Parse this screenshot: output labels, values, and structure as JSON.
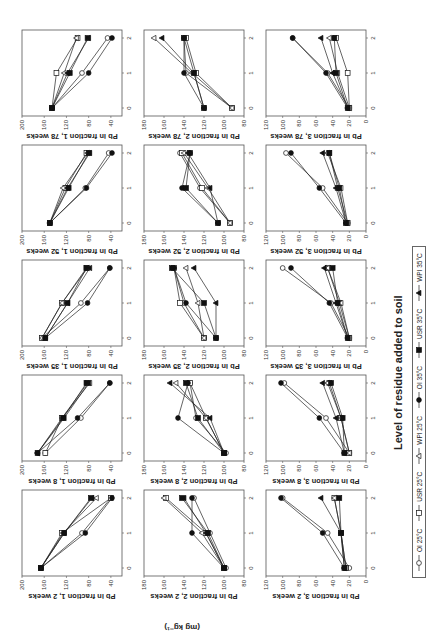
{
  "figure": {
    "x_title": "Level of residue added to soil",
    "units_label": "(mg kg⁻¹)"
  },
  "legend": [
    {
      "label": "OI 25°C",
      "marker": "circle",
      "filled": false
    },
    {
      "label": "USR 25°C",
      "marker": "square",
      "filled": false
    },
    {
      "label": "WPI 25°C",
      "marker": "triangle",
      "filled": false
    },
    {
      "label": "OI 35°C",
      "marker": "circle",
      "filled": true
    },
    {
      "label": "USR 35°C",
      "marker": "square",
      "filled": true
    },
    {
      "label": "WPI 35°C",
      "marker": "triangle",
      "filled": true
    }
  ],
  "chart_data": [
    {
      "type": "line",
      "title": "Pb in fraction 1, 2 weeks",
      "ylabel": "Pb in fraction 1, 2 weeks",
      "x": [
        0,
        1,
        2
      ],
      "ylim": [
        20,
        200
      ],
      "yticks": [
        40,
        80,
        120,
        160,
        200
      ],
      "series": [
        {
          "name": "OI 25°C",
          "values": [
            166,
            92,
            40
          ]
        },
        {
          "name": "USR 25°C",
          "values": [
            166,
            128,
            40
          ]
        },
        {
          "name": "WPI 25°C",
          "values": [
            166,
            126,
            66
          ]
        },
        {
          "name": "OI 35°C",
          "values": [
            166,
            86,
            38
          ]
        },
        {
          "name": "USR 35°C",
          "values": [
            166,
            124,
            76
          ]
        },
        {
          "name": "WPI 35°C",
          "values": [
            166,
            124,
            74
          ]
        }
      ]
    },
    {
      "type": "line",
      "title": "Pb in fraction 1, 8 weeks",
      "ylabel": "Pb in fraction 1, 8 weeks",
      "x": [
        0,
        1,
        2
      ],
      "ylim": [
        20,
        200
      ],
      "yticks": [
        40,
        80,
        120,
        160,
        200
      ],
      "series": [
        {
          "name": "OI 25°C",
          "values": [
            158,
            94,
            42
          ]
        },
        {
          "name": "USR 25°C",
          "values": [
            158,
            128,
            82
          ]
        },
        {
          "name": "WPI 25°C",
          "values": [
            172,
            128,
            78
          ]
        },
        {
          "name": "OI 35°C",
          "values": [
            172,
            100,
            42
          ]
        },
        {
          "name": "USR 35°C",
          "values": [
            172,
            126,
            84
          ]
        },
        {
          "name": "WPI 35°C",
          "values": [
            172,
            124,
            80
          ]
        }
      ]
    },
    {
      "type": "line",
      "title": "Pb in fraction 1, 35 weeks",
      "ylabel": "Pb in fraction 1, 35 weeks",
      "x": [
        0,
        1,
        2
      ],
      "ylim": [
        20,
        200
      ],
      "yticks": [
        40,
        80,
        120,
        160,
        200
      ],
      "series": [
        {
          "name": "OI 25°C",
          "values": [
            164,
            94,
            42
          ]
        },
        {
          "name": "USR 25°C",
          "values": [
            164,
            128,
            84
          ]
        },
        {
          "name": "WPI 25°C",
          "values": [
            164,
            128,
            82
          ]
        },
        {
          "name": "OI 35°C",
          "values": [
            158,
            82,
            42
          ]
        },
        {
          "name": "USR 35°C",
          "values": [
            158,
            118,
            84
          ]
        },
        {
          "name": "WPI 35°C",
          "values": [
            158,
            118,
            78
          ]
        }
      ]
    },
    {
      "type": "line",
      "title": "Pb in fraction 1, 52 weeks",
      "ylabel": "Pb in fraction 1, 52 weeks",
      "x": [
        0,
        1,
        2
      ],
      "ylim": [
        20,
        200
      ],
      "yticks": [
        40,
        80,
        120,
        160,
        200
      ],
      "series": [
        {
          "name": "OI 25°C",
          "values": [
            150,
            86,
            44
          ]
        },
        {
          "name": "USR 25°C",
          "values": [
            150,
            122,
            84
          ]
        },
        {
          "name": "WPI 25°C",
          "values": [
            150,
            126,
            82
          ]
        },
        {
          "name": "OI 35°C",
          "values": [
            150,
            84,
            38
          ]
        },
        {
          "name": "USR 35°C",
          "values": [
            150,
            116,
            80
          ]
        },
        {
          "name": "WPI 35°C",
          "values": [
            150,
            118,
            78
          ]
        }
      ]
    },
    {
      "type": "line",
      "title": "Pb in fraction 1, 78 weeks",
      "ylabel": "Pb in fraction 1, 78 weeks",
      "x": [
        0,
        1,
        2
      ],
      "ylim": [
        20,
        200
      ],
      "yticks": [
        40,
        80,
        120,
        160,
        200
      ],
      "series": [
        {
          "name": "OI 25°C",
          "values": [
            146,
            92,
            46
          ]
        },
        {
          "name": "USR 25°C",
          "values": [
            146,
            138,
            100
          ]
        },
        {
          "name": "WPI 25°C",
          "values": [
            146,
            124,
            102
          ]
        },
        {
          "name": "OI 35°C",
          "values": [
            146,
            80,
            38
          ]
        },
        {
          "name": "USR 35°C",
          "values": [
            146,
            114,
            82
          ]
        },
        {
          "name": "WPI 35°C",
          "values": [
            146,
            118,
            80
          ]
        }
      ]
    },
    {
      "type": "line",
      "title": "Pb in fraction 2, 2 weeks",
      "ylabel": "Pb in fraction 2, 2 weeks",
      "x": [
        0,
        1,
        2
      ],
      "ylim": [
        80,
        180
      ],
      "yticks": [
        80,
        100,
        120,
        140,
        160,
        180
      ],
      "series": [
        {
          "name": "OI 25°C",
          "values": [
            98,
            114,
            130
          ]
        },
        {
          "name": "USR 25°C",
          "values": [
            100,
            118,
            158
          ]
        },
        {
          "name": "WPI 25°C",
          "values": [
            100,
            122,
            160
          ]
        },
        {
          "name": "OI 35°C",
          "values": [
            100,
            132,
            132
          ]
        },
        {
          "name": "USR 35°C",
          "values": [
            100,
            116,
            142
          ]
        },
        {
          "name": "WPI 35°C",
          "values": [
            100,
            118,
            140
          ]
        }
      ]
    },
    {
      "type": "line",
      "title": "Pb in fraction 2, 8 weeks",
      "ylabel": "Pb in fraction 2, 8 weeks",
      "x": [
        0,
        1,
        2
      ],
      "ylim": [
        80,
        180
      ],
      "yticks": [
        80,
        100,
        120,
        140,
        160,
        180
      ],
      "series": [
        {
          "name": "OI 25°C",
          "values": [
            98,
            128,
            134
          ]
        },
        {
          "name": "USR 25°C",
          "values": [
            100,
            118,
            134
          ]
        },
        {
          "name": "WPI 25°C",
          "values": [
            100,
            118,
            148
          ]
        },
        {
          "name": "OI 35°C",
          "values": [
            100,
            146,
            136
          ]
        },
        {
          "name": "USR 35°C",
          "values": [
            100,
            126,
            138
          ]
        },
        {
          "name": "WPI 35°C",
          "values": [
            100,
            114,
            154
          ]
        }
      ]
    },
    {
      "type": "line",
      "title": "Pb in fraction 2, 35 weeks",
      "ylabel": "Pb in fraction 2, 35 weeks",
      "x": [
        0,
        1,
        2
      ],
      "ylim": [
        80,
        180
      ],
      "yticks": [
        80,
        100,
        120,
        140,
        160,
        180
      ],
      "series": [
        {
          "name": "OI 25°C",
          "values": [
            120,
            140,
            150
          ]
        },
        {
          "name": "USR 25°C",
          "values": [
            120,
            144,
            150
          ]
        },
        {
          "name": "WPI 25°C",
          "values": [
            120,
            126,
            138
          ]
        },
        {
          "name": "OI 35°C",
          "values": [
            108,
            138,
            150
          ]
        },
        {
          "name": "USR 35°C",
          "values": [
            108,
            120,
            152
          ]
        },
        {
          "name": "WPI 35°C",
          "values": [
            108,
            108,
            130
          ]
        }
      ]
    },
    {
      "type": "line",
      "title": "Pb in fraction 2, 52 weeks",
      "ylabel": "Pb in fraction 2, 52 weeks",
      "x": [
        0,
        1,
        2
      ],
      "ylim": [
        80,
        180
      ],
      "yticks": [
        80,
        100,
        120,
        140,
        160,
        180
      ],
      "series": [
        {
          "name": "OI 25°C",
          "values": [
            94,
            124,
            144
          ]
        },
        {
          "name": "USR 25°C",
          "values": [
            94,
            122,
            142
          ]
        },
        {
          "name": "WPI 25°C",
          "values": [
            94,
            116,
            140
          ]
        },
        {
          "name": "OI 35°C",
          "values": [
            106,
            142,
            134
          ]
        },
        {
          "name": "USR 35°C",
          "values": [
            106,
            138,
            134
          ]
        },
        {
          "name": "WPI 35°C",
          "values": [
            106,
            114,
            136
          ]
        }
      ]
    },
    {
      "type": "line",
      "title": "Pb in fraction 2, 78 weeks",
      "ylabel": "Pb in fraction 2, 78 weeks",
      "x": [
        0,
        1,
        2
      ],
      "ylim": [
        80,
        180
      ],
      "yticks": [
        80,
        100,
        120,
        140,
        160,
        180
      ],
      "series": [
        {
          "name": "OI 25°C",
          "values": [
            92,
            138,
            140
          ]
        },
        {
          "name": "USR 25°C",
          "values": [
            92,
            128,
            138
          ]
        },
        {
          "name": "WPI 25°C",
          "values": [
            92,
            132,
            170
          ]
        },
        {
          "name": "OI 35°C",
          "values": [
            120,
            140,
            140
          ]
        },
        {
          "name": "USR 35°C",
          "values": [
            120,
            130,
            140
          ]
        },
        {
          "name": "WPI 35°C",
          "values": [
            120,
            130,
            162
          ]
        }
      ]
    },
    {
      "type": "line",
      "title": "Pb in fraction 3, 2 weeks",
      "ylabel": "Pb in fraction 3, 2 weeks",
      "x": [
        0,
        1,
        2
      ],
      "ylim": [
        0,
        120
      ],
      "yticks": [
        0,
        20,
        40,
        60,
        80,
        100,
        120
      ],
      "series": [
        {
          "name": "OI 25°C",
          "values": [
            20,
            46,
            100
          ]
        },
        {
          "name": "USR 25°C",
          "values": [
            24,
            30,
            38
          ]
        },
        {
          "name": "WPI 25°C",
          "values": [
            24,
            30,
            38
          ]
        },
        {
          "name": "OI 35°C",
          "values": [
            26,
            52,
            102
          ]
        },
        {
          "name": "USR 35°C",
          "values": [
            26,
            30,
            32
          ]
        },
        {
          "name": "WPI 35°C",
          "values": [
            26,
            30,
            54
          ]
        }
      ]
    },
    {
      "type": "line",
      "title": "Pb in fraction 3, 8 weeks",
      "ylabel": "Pb in fraction 3, 8 weeks",
      "x": [
        0,
        1,
        2
      ],
      "ylim": [
        0,
        120
      ],
      "yticks": [
        0,
        20,
        40,
        60,
        80,
        100,
        120
      ],
      "series": [
        {
          "name": "OI 25°C",
          "values": [
            20,
            48,
            98
          ]
        },
        {
          "name": "USR 25°C",
          "values": [
            20,
            30,
            44
          ]
        },
        {
          "name": "WPI 25°C",
          "values": [
            20,
            30,
            46
          ]
        },
        {
          "name": "OI 35°C",
          "values": [
            26,
            56,
            102
          ]
        },
        {
          "name": "USR 35°C",
          "values": [
            26,
            28,
            42
          ]
        },
        {
          "name": "WPI 35°C",
          "values": [
            26,
            36,
            52
          ]
        }
      ]
    },
    {
      "type": "line",
      "title": "Pb in fraction 3, 35 weeks",
      "ylabel": "Pb in fraction 3, 35 weeks",
      "x": [
        0,
        1,
        2
      ],
      "ylim": [
        0,
        120
      ],
      "yticks": [
        0,
        20,
        40,
        60,
        80,
        100,
        120
      ],
      "series": [
        {
          "name": "OI 25°C",
          "values": [
            20,
            42,
            100
          ]
        },
        {
          "name": "USR 25°C",
          "values": [
            20,
            32,
            46
          ]
        },
        {
          "name": "WPI 25°C",
          "values": [
            20,
            30,
            46
          ]
        },
        {
          "name": "OI 35°C",
          "values": [
            22,
            44,
            90
          ]
        },
        {
          "name": "USR 35°C",
          "values": [
            22,
            34,
            40
          ]
        },
        {
          "name": "WPI 35°C",
          "values": [
            22,
            36,
            50
          ]
        }
      ]
    },
    {
      "type": "line",
      "title": "Pb in fraction 3, 52 weeks",
      "ylabel": "Pb in fraction 3, 52 weeks",
      "x": [
        0,
        1,
        2
      ],
      "ylim": [
        0,
        120
      ],
      "yticks": [
        0,
        20,
        40,
        60,
        80,
        100,
        120
      ],
      "series": [
        {
          "name": "OI 25°C",
          "values": [
            22,
            52,
            96
          ]
        },
        {
          "name": "USR 25°C",
          "values": [
            22,
            34,
            44
          ]
        },
        {
          "name": "WPI 25°C",
          "values": [
            22,
            30,
            46
          ]
        },
        {
          "name": "OI 35°C",
          "values": [
            24,
            56,
            90
          ]
        },
        {
          "name": "USR 35°C",
          "values": [
            24,
            32,
            44
          ]
        },
        {
          "name": "WPI 35°C",
          "values": [
            24,
            36,
            52
          ]
        }
      ]
    },
    {
      "type": "line",
      "title": "Pb in fraction 3, 78 weeks",
      "ylabel": "Pb in fraction 3, 78 weeks",
      "x": [
        0,
        1,
        2
      ],
      "ylim": [
        0,
        120
      ],
      "yticks": [
        0,
        20,
        40,
        60,
        80,
        100,
        120
      ],
      "series": [
        {
          "name": "OI 25°C",
          "values": [
            20,
            46,
            88
          ]
        },
        {
          "name": "USR 25°C",
          "values": [
            20,
            22,
            36
          ]
        },
        {
          "name": "WPI 25°C",
          "values": [
            20,
            34,
            44
          ]
        },
        {
          "name": "OI 35°C",
          "values": [
            22,
            48,
            88
          ]
        },
        {
          "name": "USR 35°C",
          "values": [
            22,
            36,
            38
          ]
        },
        {
          "name": "WPI 35°C",
          "values": [
            22,
            40,
            54
          ]
        }
      ]
    }
  ]
}
